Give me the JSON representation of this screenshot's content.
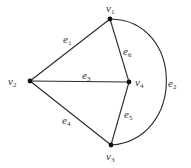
{
  "diagram": {
    "type": "graph",
    "vertices": [
      {
        "id": "v1",
        "label": "v",
        "sub": "1",
        "x": 110,
        "y": 19,
        "lx": 106,
        "ly": 12
      },
      {
        "id": "v2",
        "label": "v",
        "sub": "2",
        "x": 30,
        "y": 81,
        "lx": 8,
        "ly": 85
      },
      {
        "id": "v3",
        "label": "v",
        "sub": "3",
        "x": 111,
        "y": 145,
        "lx": 106,
        "ly": 160
      },
      {
        "id": "v4",
        "label": "v",
        "sub": "4",
        "x": 129,
        "y": 82,
        "lx": 135,
        "ly": 86
      }
    ],
    "edges": [
      {
        "id": "e1",
        "label": "e",
        "sub": "1",
        "from": "v2",
        "to": "v1",
        "lx": 63,
        "ly": 43
      },
      {
        "id": "e2",
        "label": "e",
        "sub": "2",
        "from": "v1",
        "to": "v3",
        "curved": true,
        "lx": 168,
        "ly": 87
      },
      {
        "id": "e3",
        "label": "e",
        "sub": "3",
        "from": "v2",
        "to": "v4",
        "lx": 82,
        "ly": 79
      },
      {
        "id": "e4",
        "label": "e",
        "sub": "4",
        "from": "v2",
        "to": "v3",
        "lx": 62,
        "ly": 124
      },
      {
        "id": "e5",
        "label": "e",
        "sub": "5",
        "from": "v4",
        "to": "v3",
        "lx": 124,
        "ly": 118
      },
      {
        "id": "e6",
        "label": "e",
        "sub": "6",
        "from": "v1",
        "to": "v4",
        "lx": 123,
        "ly": 55
      }
    ]
  }
}
